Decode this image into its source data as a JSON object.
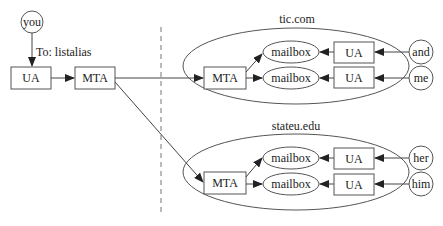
{
  "diagram": {
    "sender": {
      "person": "you",
      "edge_label": "To: listalias",
      "ua": "UA",
      "mta": "MTA"
    },
    "domains": [
      {
        "name": "tic.com",
        "mta": "MTA",
        "mailboxes": [
          "mailbox",
          "mailbox"
        ],
        "uas": [
          "UA",
          "UA"
        ],
        "users": [
          "and",
          "me"
        ]
      },
      {
        "name": "stateu.edu",
        "mta": "MTA",
        "mailboxes": [
          "mailbox",
          "mailbox"
        ],
        "uas": [
          "UA",
          "UA"
        ],
        "users": [
          "her",
          "him"
        ]
      }
    ]
  }
}
